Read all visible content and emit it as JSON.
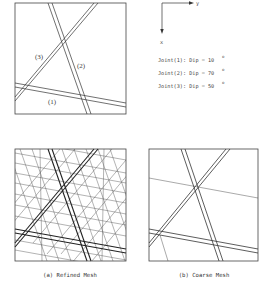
{
  "figure": {
    "axes": {
      "x_label": "x",
      "y_label": "y"
    },
    "joints": [
      {
        "label": "(1)",
        "text": "Joint(1): Dip = 10",
        "dip": 10
      },
      {
        "label": "(2)",
        "text": "Joint(2): Dip = 70",
        "dip": 70
      },
      {
        "label": "(3)",
        "text": "Joint(3): Dip = 50",
        "dip": 50
      }
    ],
    "degree_symbol": "o",
    "captions": {
      "a": "(a) Refined Mesh",
      "b": "(b) Coarse Mesh"
    }
  },
  "colors": {
    "line": "#333333",
    "frame": "#444444",
    "mesh": "#555555",
    "background": "#ffffff"
  }
}
